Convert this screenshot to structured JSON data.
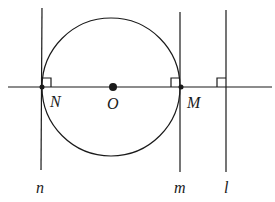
{
  "diagram": {
    "points": {
      "N": "N",
      "O": "O",
      "M": "M"
    },
    "lines": {
      "n": "n",
      "m": "m",
      "l": "l"
    },
    "colors": {
      "stroke": "#1a1a1a",
      "background": "#ffffff"
    }
  }
}
